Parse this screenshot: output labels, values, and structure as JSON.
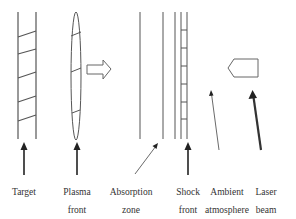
{
  "diagram": {
    "type": "laser-plasma schematic",
    "labels": [
      {
        "id": "target",
        "line1": "Target",
        "line2": "",
        "x": 24
      },
      {
        "id": "plasma-front",
        "line1": "Plasma",
        "line2": "front",
        "x": 77
      },
      {
        "id": "absorption-zone",
        "line1": "Absorption",
        "line2": "zone",
        "x": 131
      },
      {
        "id": "shock-front",
        "line1": "Shock",
        "line2": "front",
        "x": 188
      },
      {
        "id": "ambient-atmosphere",
        "line1": "Ambient",
        "line2": "atmosphere",
        "x": 226
      },
      {
        "id": "laser-beam",
        "line1": "Laser",
        "line2": "beam",
        "x": 266
      }
    ],
    "colors": {
      "line": "#555555",
      "arrow": "#222222",
      "text": "#333333"
    }
  }
}
